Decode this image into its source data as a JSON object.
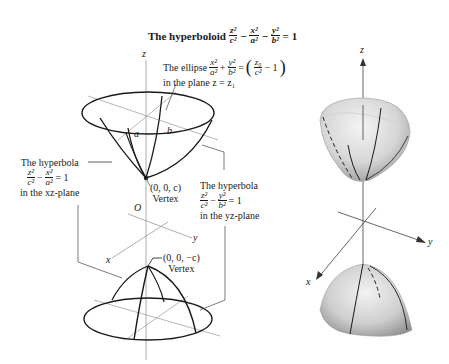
{
  "title": {
    "prefix": "The hyperboloid",
    "terms": [
      {
        "num": "z²",
        "den": "c²"
      },
      {
        "op": "−"
      },
      {
        "num": "x²",
        "den": "a²"
      },
      {
        "op": "−"
      },
      {
        "num": "y²",
        "den": "b²"
      }
    ],
    "rhs": "= 1"
  },
  "left_diagram": {
    "axis_labels": {
      "z": "z",
      "x": "x",
      "y": "y",
      "origin": "O"
    },
    "ellipse_label": {
      "line1_prefix": "The ellipse",
      "t1_num": "x²",
      "t1_den": "a²",
      "plus": "+",
      "t2_num": "y²",
      "t2_den": "b²",
      "eq": "=",
      "rhs_open": "(",
      "rhs_num": "z₀",
      "rhs_den": "c²",
      "rhs_minus": "− 1",
      "rhs_close": ")",
      "line2": "in the plane z = z₁"
    },
    "semi_axis_labels": {
      "a": "a",
      "b": "b"
    },
    "hyperbola_xz": {
      "line1": "The hyperbola",
      "t1_num": "z²",
      "t1_den": "c²",
      "minus": "−",
      "t2_num": "x²",
      "t2_den": "a²",
      "rhs": "= 1",
      "line3": "in the xz-plane"
    },
    "hyperbola_yz": {
      "line1": "The hyperbola",
      "t1_num": "z²",
      "t1_den": "c²",
      "minus": "−",
      "t2_num": "y²",
      "t2_den": "b²",
      "rhs": "= 1",
      "line3": "in the yz-plane"
    },
    "vertex_top": {
      "coords": "(0, 0, c)",
      "label": "Vertex"
    },
    "vertex_bottom": {
      "coords": "(0, 0, −c)",
      "label": "Vertex"
    }
  },
  "right_diagram": {
    "axis_labels": {
      "z": "z",
      "x": "x",
      "y": "y"
    }
  },
  "colors": {
    "ink": "#1a1a1a",
    "axis": "#9a9a9a",
    "surface_light": "#ececec",
    "surface_dark": "#a8a8a8"
  }
}
